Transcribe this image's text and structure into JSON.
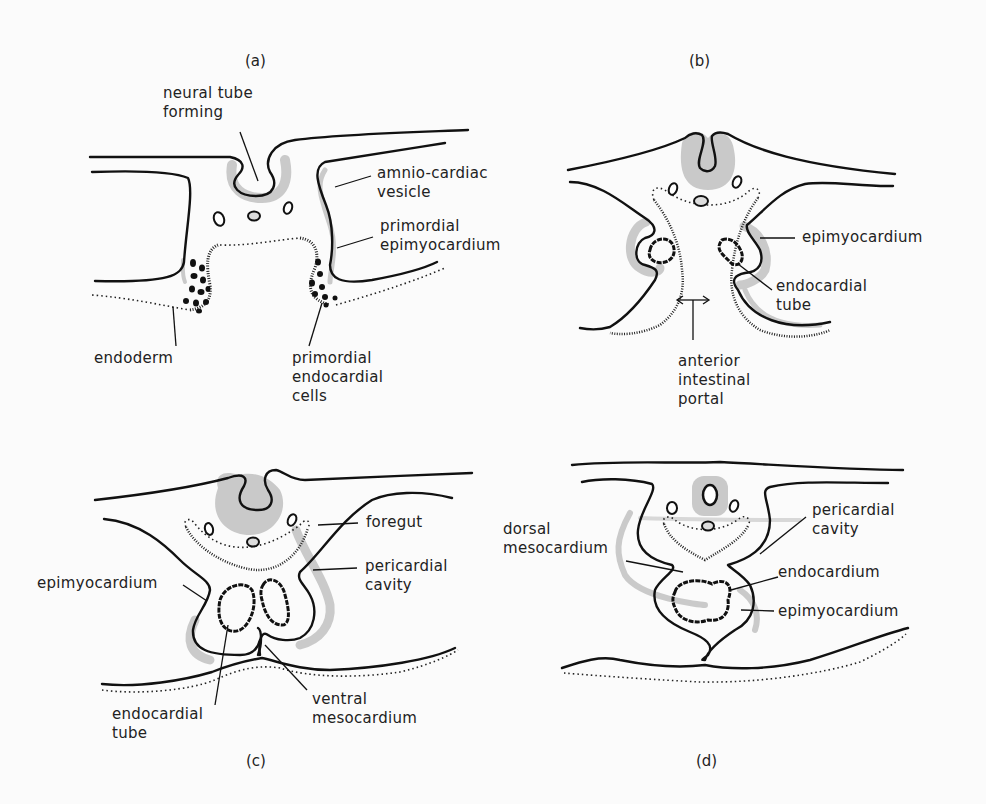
{
  "figure": {
    "background": "#fbfbfb",
    "shade_color": "#c9c9c9",
    "line_color": "#111111"
  },
  "panels": {
    "a": {
      "id_label": "(a)",
      "labels": {
        "neural_tube": "neural tube\nforming",
        "amnio_cardiac": "amnio-cardiac\nvesicle",
        "primordial_epi": "primordial\nepimyocardium",
        "endoderm": "endoderm",
        "primordial_endo": "primordial\nendocardial\ncells"
      }
    },
    "b": {
      "id_label": "(b)",
      "labels": {
        "epimyocardium": "epimyocardium",
        "endocardial_tube": "endocardial\ntube",
        "anterior_portal": "anterior\nintestinal\nportal"
      }
    },
    "c": {
      "id_label": "(c)",
      "labels": {
        "foregut": "foregut",
        "pericardial_cavity": "pericardial\ncavity",
        "epimyocardium": "epimyocardium",
        "endocardial_tube": "endocardial\ntube",
        "ventral_meso": "ventral\nmesocardium"
      }
    },
    "d": {
      "id_label": "(d)",
      "labels": {
        "dorsal_meso": "dorsal\nmesocardium",
        "pericardial_cavity": "pericardial\ncavity",
        "endocardium": "endocardium",
        "epimyocardium": "epimyocardium"
      }
    }
  }
}
